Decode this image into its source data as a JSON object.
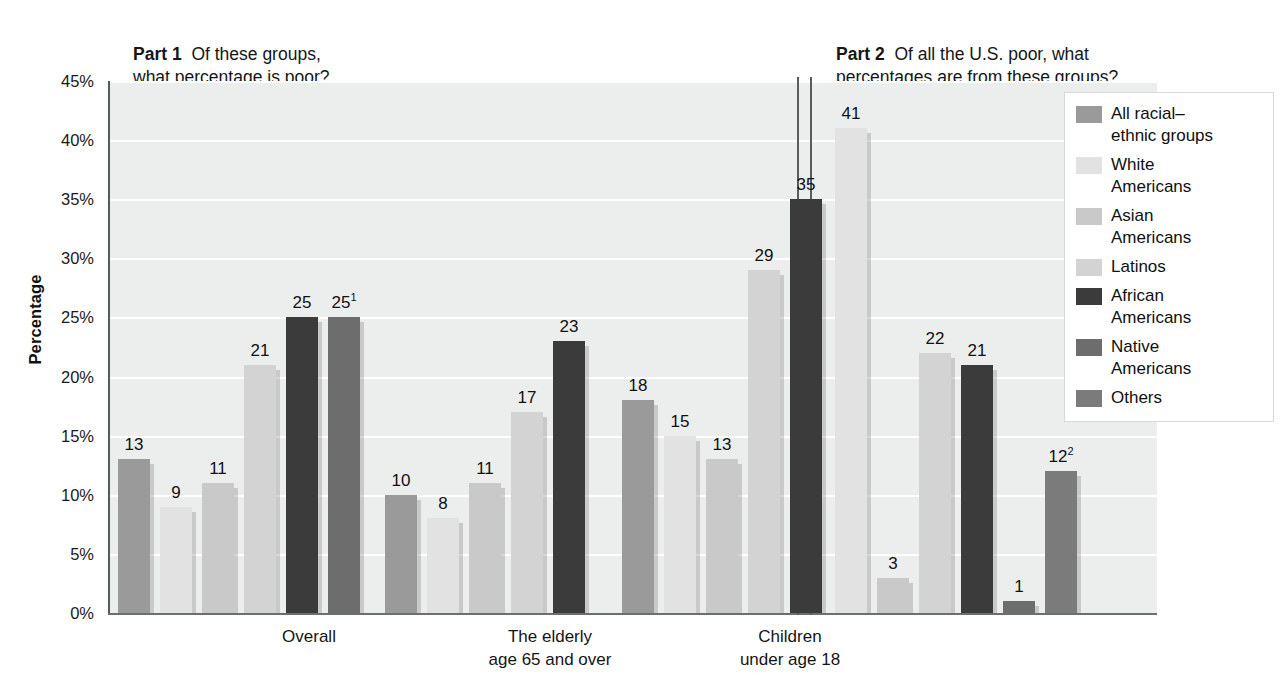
{
  "part1": {
    "label": "Part 1",
    "question": "Of these groups,\nwhat percentage is poor?"
  },
  "part2": {
    "label": "Part 2",
    "question": "Of all the U.S. poor, what\npercentages are from these groups?"
  },
  "legend": {
    "items": [
      {
        "label": "All racial–\nethnic groups",
        "color": "#9a9a9a"
      },
      {
        "label": "White\nAmericans",
        "color": "#e2e2e2"
      },
      {
        "label": "Asian\nAmericans",
        "color": "#c9c9c9"
      },
      {
        "label": "Latinos",
        "color": "#d3d3d3"
      },
      {
        "label": "African\nAmericans",
        "color": "#3b3b3b"
      },
      {
        "label": "Native\nAmericans",
        "color": "#6d6d6d"
      },
      {
        "label": "Others",
        "color": "#7b7b7b"
      }
    ]
  },
  "chart_data": {
    "type": "bar",
    "title": "",
    "xlabel": "",
    "ylabel": "Percentage",
    "ylim": [
      0,
      45
    ],
    "grid": true,
    "legend_position": "right",
    "ytick_labels": [
      "0%",
      "5%",
      "10%",
      "15%",
      "20%",
      "25%",
      "30%",
      "35%",
      "40%",
      "45%"
    ],
    "ytick_values": [
      0,
      5,
      10,
      15,
      20,
      25,
      30,
      35,
      40,
      45
    ],
    "series_names": [
      "All racial–ethnic groups",
      "White Americans",
      "Asian Americans",
      "Latinos",
      "African Americans",
      "Native Americans",
      "Others"
    ],
    "series_colors": [
      "#9a9a9a",
      "#e2e2e2",
      "#c9c9c9",
      "#d3d3d3",
      "#3b3b3b",
      "#6d6d6d",
      "#7b7b7b"
    ],
    "groups": [
      {
        "name": "Overall",
        "label": "Overall",
        "part": "Part 1",
        "bars": [
          {
            "series": "All racial–ethnic groups",
            "value": 13,
            "label": "13",
            "sup": "",
            "color": "#9a9a9a"
          },
          {
            "series": "White Americans",
            "value": 9,
            "label": "9",
            "sup": "",
            "color": "#e2e2e2"
          },
          {
            "series": "Asian Americans",
            "value": 11,
            "label": "11",
            "sup": "",
            "color": "#c9c9c9"
          },
          {
            "series": "Latinos",
            "value": 21,
            "label": "21",
            "sup": "",
            "color": "#d3d3d3"
          },
          {
            "series": "African Americans",
            "value": 25,
            "label": "25",
            "sup": "",
            "color": "#3b3b3b"
          },
          {
            "series": "Native Americans",
            "value": 25,
            "label": "25",
            "sup": "1",
            "color": "#6d6d6d"
          }
        ]
      },
      {
        "name": "The elderly age 65 and over",
        "label": "The elderly\nage 65 and over",
        "part": "Part 1",
        "bars": [
          {
            "series": "All racial–ethnic groups",
            "value": 10,
            "label": "10",
            "sup": "",
            "color": "#9a9a9a"
          },
          {
            "series": "White Americans",
            "value": 8,
            "label": "8",
            "sup": "",
            "color": "#e2e2e2"
          },
          {
            "series": "Asian Americans",
            "value": 11,
            "label": "11",
            "sup": "",
            "color": "#c9c9c9"
          },
          {
            "series": "Latinos",
            "value": 17,
            "label": "17",
            "sup": "",
            "color": "#d3d3d3"
          },
          {
            "series": "African Americans",
            "value": 23,
            "label": "23",
            "sup": "",
            "color": "#3b3b3b"
          }
        ]
      },
      {
        "name": "Children under age 18",
        "label": "Children\nunder age 18",
        "part": "Part 1",
        "bars": [
          {
            "series": "All racial–ethnic groups",
            "value": 18,
            "label": "18",
            "sup": "",
            "color": "#9a9a9a"
          },
          {
            "series": "White Americans",
            "value": 15,
            "label": "15",
            "sup": "",
            "color": "#e2e2e2"
          },
          {
            "series": "Asian Americans",
            "value": 13,
            "label": "13",
            "sup": "",
            "color": "#c9c9c9"
          },
          {
            "series": "Latinos",
            "value": 29,
            "label": "29",
            "sup": "",
            "color": "#d3d3d3"
          },
          {
            "series": "African Americans",
            "value": 35,
            "label": "35",
            "sup": "",
            "color": "#3b3b3b"
          }
        ]
      },
      {
        "name": "All U.S. poor",
        "label": "",
        "part": "Part 2",
        "bars": [
          {
            "series": "White Americans",
            "value": 41,
            "label": "41",
            "sup": "",
            "color": "#e2e2e2"
          },
          {
            "series": "Asian Americans",
            "value": 3,
            "label": "3",
            "sup": "",
            "color": "#c9c9c9"
          },
          {
            "series": "Latinos",
            "value": 22,
            "label": "22",
            "sup": "",
            "color": "#d3d3d3"
          },
          {
            "series": "African Americans",
            "value": 21,
            "label": "21",
            "sup": "",
            "color": "#3b3b3b"
          },
          {
            "series": "Native Americans",
            "value": 1,
            "label": "1",
            "sup": "",
            "color": "#6d6d6d"
          },
          {
            "series": "Others",
            "value": 12,
            "label": "12",
            "sup": "2",
            "color": "#7b7b7b"
          }
        ]
      }
    ]
  },
  "layout": {
    "bar_width": 32,
    "bar_gap": 10,
    "group_starts": [
      8,
      275,
      512,
      725
    ],
    "group_label_centers": [
      199,
      440,
      680
    ]
  }
}
